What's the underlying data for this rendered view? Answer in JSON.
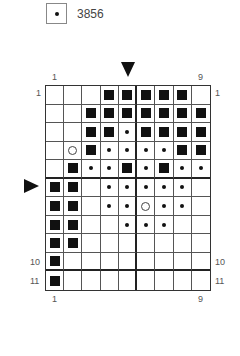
{
  "legend": {
    "symbol": "dot",
    "label": "3856"
  },
  "chart_data": {
    "type": "table",
    "columns": 9,
    "rows": 11,
    "symbols": {
      "F": "filled-square",
      "D": "dot",
      "O": "open-circle",
      "E": "empty"
    },
    "cells": [
      [
        "E",
        "E",
        "E",
        "F",
        "F",
        "F",
        "F",
        "F",
        "E"
      ],
      [
        "E",
        "E",
        "F",
        "F",
        "F",
        "F",
        "F",
        "F",
        "F"
      ],
      [
        "E",
        "E",
        "F",
        "F",
        "D",
        "F",
        "F",
        "F",
        "F"
      ],
      [
        "E",
        "O",
        "F",
        "D",
        "D",
        "D",
        "D",
        "F",
        "F"
      ],
      [
        "E",
        "F",
        "D",
        "D",
        "F",
        "D",
        "F",
        "D",
        "D"
      ],
      [
        "F",
        "F",
        "E",
        "D",
        "D",
        "D",
        "D",
        "D",
        "E"
      ],
      [
        "F",
        "F",
        "E",
        "D",
        "D",
        "O",
        "D",
        "D",
        "E"
      ],
      [
        "F",
        "F",
        "E",
        "E",
        "D",
        "D",
        "D",
        "E",
        "E"
      ],
      [
        "F",
        "F",
        "E",
        "E",
        "E",
        "E",
        "E",
        "E",
        "E"
      ],
      [
        "F",
        "E",
        "E",
        "E",
        "E",
        "E",
        "E",
        "E",
        "E"
      ],
      [
        "F",
        "E",
        "E",
        "E",
        "E",
        "E",
        "E",
        "E",
        "E"
      ]
    ],
    "top_labels": {
      "left": "1",
      "right": "9"
    },
    "bottom_labels": {
      "left": "1",
      "right": "9"
    },
    "left_labels": {
      "row1": "1",
      "row10": "10",
      "row11": "11"
    },
    "right_labels": {
      "row1": "1",
      "row10": "10",
      "row11": "11"
    },
    "center_markers": {
      "top_arrow_column": 5,
      "left_arrow_row": 6
    }
  },
  "labels": {
    "top_left": "1",
    "top_right": "9",
    "bottom_left": "1",
    "bottom_right": "9",
    "left_r1": "1",
    "left_r10": "10",
    "left_r11": "11",
    "right_r1": "1",
    "right_r10": "10",
    "right_r11": "11"
  }
}
